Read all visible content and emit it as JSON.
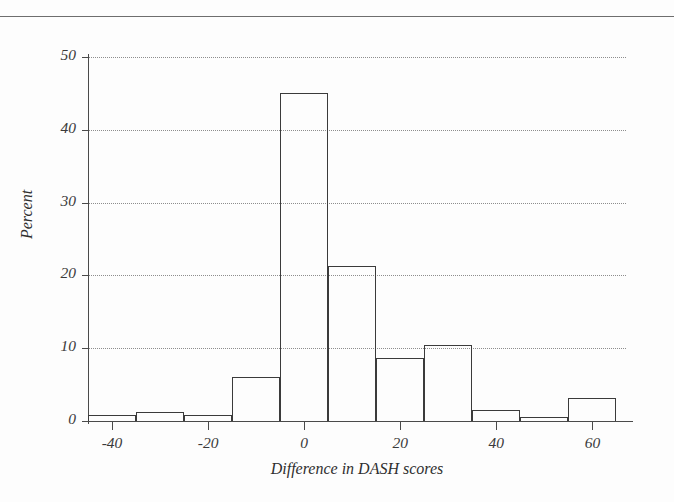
{
  "figure": {
    "background_color": "#fdfdfd",
    "line_color": "#3b3b3b",
    "grid_color": "#8d8d8d",
    "has_top_rule": true
  },
  "chart_data": {
    "type": "bar",
    "title": "",
    "subtitle": "",
    "xlabel": "Difference in DASH scores",
    "ylabel": "Percent",
    "xlim": [
      -45,
      67
    ],
    "ylim": [
      0,
      50
    ],
    "xticks": [
      -40,
      -20,
      0,
      20,
      40,
      60
    ],
    "xticklabels": [
      "-40",
      "-20",
      "0",
      "20",
      "40",
      "60"
    ],
    "yticks": [
      0,
      10,
      20,
      30,
      40,
      50
    ],
    "yticklabels": [
      "0",
      "10",
      "20",
      "30",
      "40",
      "50"
    ],
    "grid": "horizontal-dotted",
    "legend": "none",
    "annotations": [],
    "bin_width": 10,
    "bin_edges": [
      -45,
      -35,
      -25,
      -15,
      -5,
      5,
      15,
      25,
      35,
      45,
      55,
      65
    ],
    "bin_labels": [
      "-45 to -35",
      "-35 to -25",
      "-25 to -15",
      "-15 to -5",
      "-5 to 5",
      "5 to 15",
      "15 to 25",
      "25 to 35",
      "35 to 45",
      "45 to 55",
      "55 to 65"
    ],
    "categories": [
      "-40",
      "-30",
      "-20",
      "-10",
      "0",
      "10",
      "20",
      "30",
      "40",
      "50",
      "60"
    ],
    "values": [
      0.8,
      1.2,
      0.8,
      6.0,
      45.0,
      21.3,
      8.7,
      10.4,
      1.5,
      0.6,
      3.2
    ]
  }
}
